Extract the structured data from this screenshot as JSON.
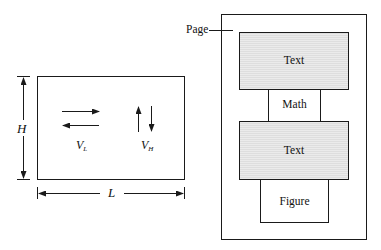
{
  "colors": {
    "stroke": "#1a1a1a",
    "text_fill": "#dcdcdc",
    "text_fill_stripe": "#eaeaea",
    "background": "#ffffff"
  },
  "left_diagram": {
    "height_label": "H",
    "length_label": "L",
    "horizontal_velocity": {
      "symbol": "V",
      "subscript": "L"
    },
    "vertical_velocity": {
      "symbol": "V",
      "subscript": "H"
    }
  },
  "right_diagram": {
    "page_label": "Page",
    "blocks": [
      {
        "label": "Text",
        "type": "text"
      },
      {
        "label": "Math",
        "type": "math"
      },
      {
        "label": "Text",
        "type": "text"
      },
      {
        "label": "Figure",
        "type": "figure"
      }
    ]
  }
}
